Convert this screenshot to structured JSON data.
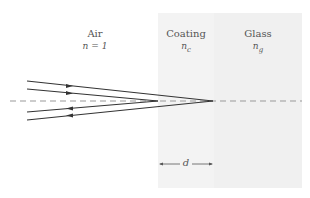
{
  "regions": [
    {
      "name": "Air",
      "index_label": "n = 1"
    },
    {
      "name": "Coating",
      "index_label": "n_c",
      "index_base": "n",
      "index_sub": "c",
      "fill": "#f3f3f3"
    },
    {
      "name": "Glass",
      "index_label": "n_g",
      "index_base": "n",
      "index_sub": "g",
      "fill": "#f0f0f0"
    }
  ],
  "dimension": {
    "label": "d"
  },
  "colors": {
    "ray": "#333333",
    "axis_dash": "#999999",
    "text": "#555555"
  }
}
